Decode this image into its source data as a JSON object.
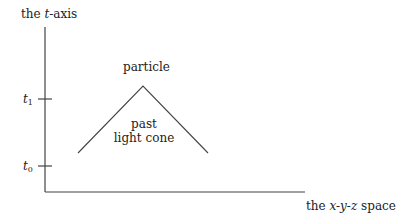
{
  "diagram": {
    "axes": {
      "vertical_label_prefix": "the ",
      "vertical_label_var": "t",
      "vertical_label_suffix": "-axis",
      "horizontal_label_prefix": "the ",
      "horizontal_label_vars": "x-y-z",
      "horizontal_label_suffix": " space"
    },
    "ticks": [
      {
        "var": "t",
        "sub": "1"
      },
      {
        "var": "t",
        "sub": "0"
      }
    ],
    "particle_label": "particle",
    "cone_label_line1": "past",
    "cone_label_line2": "light cone",
    "colors": {
      "line": "#444444",
      "text": "#222222",
      "background": "#ffffff"
    }
  }
}
